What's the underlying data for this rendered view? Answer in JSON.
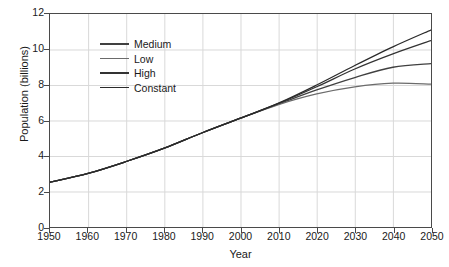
{
  "chart_data": {
    "type": "line",
    "title": "",
    "xlabel": "Year",
    "ylabel": "Population (billions)",
    "xlim": [
      1950,
      2050
    ],
    "ylim": [
      0,
      12
    ],
    "xticks": [
      1950,
      1960,
      1970,
      1980,
      1990,
      2000,
      2010,
      2020,
      2030,
      2040,
      2050
    ],
    "yticks": [
      0,
      2,
      4,
      6,
      8,
      10,
      12
    ],
    "grid": true,
    "legend_position": "upper-left-inside",
    "x": [
      1950,
      1960,
      1970,
      1980,
      1990,
      2000,
      2010,
      2020,
      2030,
      2040,
      2050
    ],
    "series": [
      {
        "name": "Medium",
        "color": "#404040",
        "values": [
          2.52,
          3.02,
          3.69,
          4.44,
          5.31,
          6.13,
          6.93,
          7.72,
          8.42,
          9.0,
          9.2
        ]
      },
      {
        "name": "Low",
        "color": "#6b6b6b",
        "values": [
          2.52,
          3.02,
          3.69,
          4.44,
          5.31,
          6.13,
          6.9,
          7.5,
          7.9,
          8.1,
          8.05
        ]
      },
      {
        "name": "High",
        "color": "#333333",
        "values": [
          2.52,
          3.02,
          3.69,
          4.44,
          5.31,
          6.13,
          6.96,
          7.9,
          8.9,
          9.75,
          10.5
        ]
      },
      {
        "name": "Constant",
        "color": "#2a2a2a",
        "values": [
          2.52,
          3.02,
          3.69,
          4.44,
          5.31,
          6.13,
          6.98,
          8.0,
          9.1,
          10.15,
          11.1
        ]
      }
    ]
  },
  "legend": {
    "items": [
      {
        "label": "Medium"
      },
      {
        "label": "Low"
      },
      {
        "label": "High"
      },
      {
        "label": "Constant"
      }
    ]
  },
  "style": {
    "axis_color": "#4a4a4a",
    "grid_color": "#d9d9d9",
    "background": "#ffffff",
    "text_color": "#1a1a1a"
  }
}
